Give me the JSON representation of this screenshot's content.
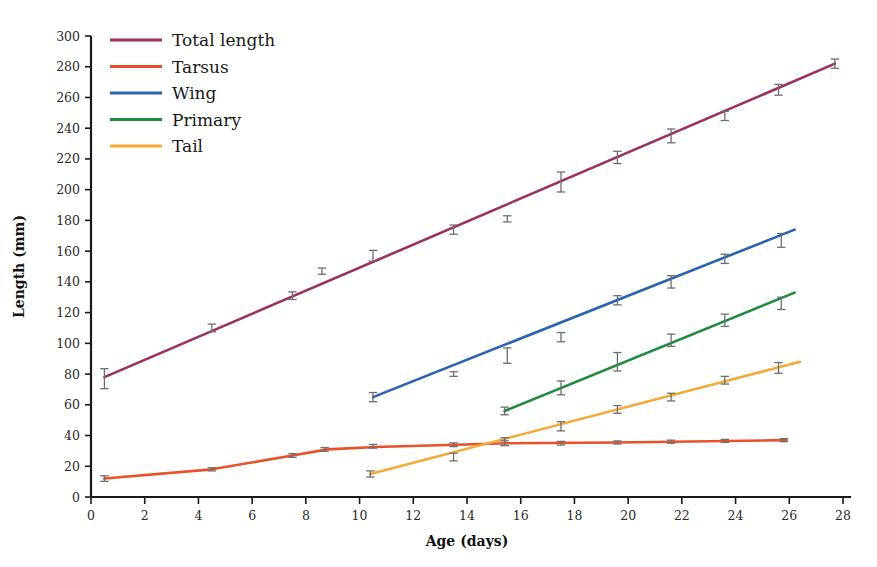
{
  "chart_data": {
    "type": "line",
    "title": "",
    "xlabel": "Age (days)",
    "ylabel": "Length (mm)",
    "xlim": [
      0,
      28
    ],
    "ylim": [
      0,
      300
    ],
    "xticks": [
      0,
      2,
      4,
      6,
      8,
      10,
      12,
      14,
      16,
      18,
      20,
      22,
      24,
      26,
      28
    ],
    "yticks": [
      0,
      20,
      40,
      60,
      80,
      100,
      120,
      140,
      160,
      180,
      200,
      220,
      240,
      260,
      280,
      300
    ],
    "grid": false,
    "legend_position": "top-left",
    "series": [
      {
        "name": "Total length",
        "color": "#9c3060",
        "x": [
          0.5,
          4.5,
          7.5,
          8.6,
          10.5,
          13.5,
          15.5,
          17.5,
          19.6,
          21.6,
          23.6,
          25.6,
          27.7
        ],
        "y": [
          77,
          110,
          131,
          147,
          157,
          174,
          181,
          205,
          221,
          235,
          248,
          265,
          282
        ],
        "yerr": [
          6.5,
          2.5,
          2.5,
          2.0,
          3.5,
          3.0,
          2.0,
          6.5,
          4.0,
          4.5,
          3.0,
          3.5,
          3.0
        ]
      },
      {
        "name": "Tarsus",
        "color": "#e8512a",
        "x": [
          0.5,
          4.5,
          7.5,
          8.7,
          10.5,
          13.5,
          15.4,
          17.5,
          19.6,
          21.6,
          23.6,
          25.8
        ],
        "y": [
          12,
          18,
          27,
          31,
          33,
          34,
          35,
          35,
          35.5,
          36,
          36.5,
          37
        ],
        "yerr": [
          1.8,
          1.0,
          1.2,
          1.2,
          1.2,
          1.2,
          1.5,
          1.2,
          1.0,
          1.0,
          1.0,
          1.0
        ]
      },
      {
        "name": "Wing",
        "color": "#2a64b0",
        "x": [
          10.5,
          13.5,
          15.5,
          17.5,
          19.6,
          21.6,
          23.6,
          25.7
        ],
        "y": [
          65,
          80,
          92,
          104,
          128,
          140,
          155,
          167
        ],
        "yerr": [
          3.0,
          1.5,
          5.0,
          3.0,
          3.0,
          4.0,
          3.0,
          4.5
        ]
      },
      {
        "name": "Primary",
        "color": "#218a3c",
        "x": [
          15.4,
          17.5,
          19.6,
          21.6,
          23.6,
          25.7
        ],
        "y": [
          56,
          71,
          88,
          102,
          115,
          126
        ],
        "yerr": [
          2.5,
          4.5,
          6.0,
          4.0,
          4.0,
          4.0
        ]
      },
      {
        "name": "Tail",
        "color": "#f4aa36",
        "x": [
          10.4,
          13.5,
          15.4,
          17.5,
          19.6,
          21.6,
          23.6,
          25.6
        ],
        "y": [
          15,
          26,
          36,
          46,
          57,
          65,
          76,
          84
        ],
        "yerr": [
          2.0,
          2.5,
          2.5,
          3.0,
          2.5,
          2.5,
          2.5,
          3.5
        ]
      }
    ],
    "line_fits": [
      {
        "name": "Total length",
        "x0": 0.5,
        "y0": 78,
        "x1": 27.7,
        "y1": 282
      },
      {
        "name": "Tarsus",
        "x0": 0.5,
        "y0": 12,
        "x1": 25.9,
        "y1": 37,
        "path": [
          [
            0.5,
            12
          ],
          [
            4.5,
            18
          ],
          [
            7.5,
            27
          ],
          [
            8.8,
            31
          ],
          [
            10.6,
            32.5
          ],
          [
            13.6,
            34
          ],
          [
            15.5,
            35
          ],
          [
            19.6,
            35.5
          ],
          [
            25.9,
            37
          ]
        ]
      },
      {
        "name": "Wing",
        "x0": 10.5,
        "y0": 65,
        "x1": 26.2,
        "y1": 174
      },
      {
        "name": "Primary",
        "x0": 15.4,
        "y0": 56,
        "x1": 26.2,
        "y1": 133
      },
      {
        "name": "Tail",
        "x0": 10.4,
        "y0": 15,
        "x1": 26.4,
        "y1": 88
      }
    ]
  },
  "legend": {
    "items": [
      {
        "label": "Total length",
        "color": "#9c3060"
      },
      {
        "label": "Tarsus",
        "color": "#e8512a"
      },
      {
        "label": "Wing",
        "color": "#2a64b0"
      },
      {
        "label": "Primary",
        "color": "#218a3c"
      },
      {
        "label": "Tail",
        "color": "#f4aa36"
      }
    ]
  },
  "axes": {
    "x_title": "Age (days)",
    "y_title": "Length (mm)"
  }
}
